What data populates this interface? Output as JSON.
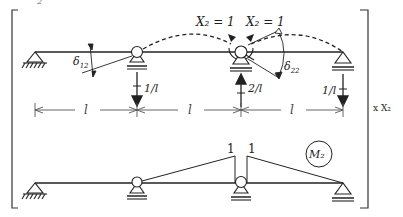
{
  "diagram": {
    "title_fragment": "2",
    "unit_state": {
      "labels": {
        "moment_left": "X₂ = 1",
        "moment_right": "X₂ = 1",
        "delta12": "δ",
        "delta12_sub": "12",
        "delta22": "δ",
        "delta22_sub": "22",
        "reaction_left": "1/l",
        "reaction_mid": "2/l",
        "reaction_right": "1/l"
      },
      "spans": [
        "l",
        "l",
        "l"
      ]
    },
    "multiplier": "x X₂",
    "moment_diagram": {
      "label": "M₂",
      "left_value": "1",
      "right_value": "1"
    },
    "colors": {
      "line": "#2a2a2a",
      "dim": "#555555"
    }
  }
}
